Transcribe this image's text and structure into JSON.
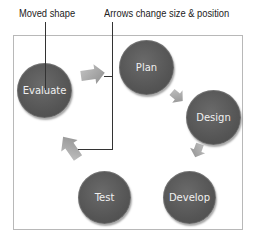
{
  "callouts": {
    "moved_shape": "Moved shape",
    "arrows_change": "Arrows change size & position"
  },
  "nodes": [
    {
      "id": "evaluate",
      "label": "Evaluate"
    },
    {
      "id": "plan",
      "label": "Plan"
    },
    {
      "id": "design",
      "label": "Design"
    },
    {
      "id": "develop",
      "label": "Develop"
    },
    {
      "id": "test",
      "label": "Test"
    }
  ],
  "colors": {
    "node_fill": "#555555",
    "arrow_fill": "#a8a8a8",
    "frame_border": "#b8b8b8",
    "callout_line": "#333333"
  }
}
